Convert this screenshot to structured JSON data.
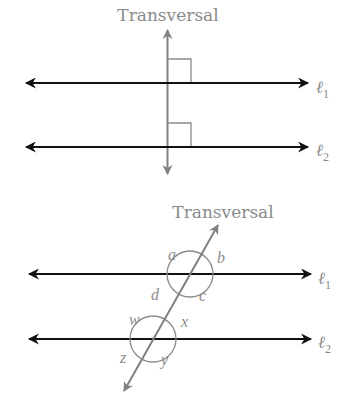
{
  "figure_top": {
    "title": "Transversal",
    "line1_label": "ℓ",
    "line1_sub": "1",
    "line2_label": "ℓ",
    "line2_sub": "2",
    "right_angle_marks": 2
  },
  "figure_bottom": {
    "title": "Transversal",
    "line1_label": "ℓ",
    "line1_sub": "1",
    "line2_label": "ℓ",
    "line2_sub": "2",
    "angles_line1": [
      "a",
      "b",
      "c",
      "d"
    ],
    "angles_line2": [
      "w",
      "x",
      "y",
      "z"
    ]
  },
  "colors": {
    "parallel_lines": "#111111",
    "transversal": "#808080",
    "labels": "#8a8a8a",
    "marks": "#8a8a8a"
  }
}
